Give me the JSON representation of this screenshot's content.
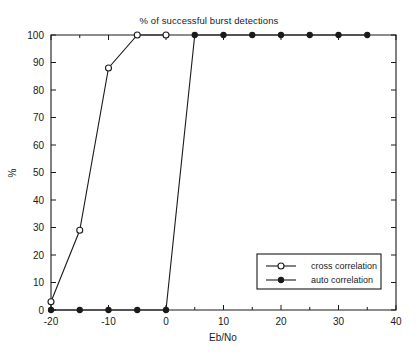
{
  "chart_data": {
    "type": "line",
    "title": "% of successful burst detections",
    "xlabel": "Eb/No",
    "ylabel": "%",
    "xlim": [
      -20,
      40
    ],
    "ylim": [
      0,
      100
    ],
    "xticks": [
      -20,
      -10,
      0,
      10,
      20,
      30,
      40
    ],
    "xtick_labels": [
      "-20",
      "-10",
      "0",
      "10",
      "20",
      "30",
      "40"
    ],
    "xminor_ticks": [
      -15,
      -5,
      5,
      15,
      25,
      35
    ],
    "yticks": [
      0,
      10,
      20,
      30,
      40,
      50,
      60,
      70,
      80,
      90,
      100
    ],
    "ytick_labels": [
      "0",
      "10",
      "20",
      "30",
      "40",
      "50",
      "60",
      "70",
      "80",
      "90",
      "100"
    ],
    "grid": false,
    "legend_position": "lower right",
    "series": [
      {
        "name": "cross correlation",
        "marker": "open-circle",
        "color": "#1a1a1a",
        "x": [
          -20,
          -15,
          -10,
          -5,
          0
        ],
        "values": [
          3,
          29,
          88,
          100,
          100
        ]
      },
      {
        "name": "auto correlation",
        "marker": "filled-circle",
        "color": "#1a1a1a",
        "x": [
          -20,
          -15,
          -10,
          -5,
          0,
          5,
          10,
          15,
          20,
          25,
          30,
          35
        ],
        "values": [
          0,
          0,
          0,
          0,
          0,
          100,
          100,
          100,
          100,
          100,
          100,
          100
        ]
      }
    ]
  },
  "legend": {
    "entries": [
      {
        "label": "cross correlation"
      },
      {
        "label": "auto correlation"
      }
    ]
  }
}
